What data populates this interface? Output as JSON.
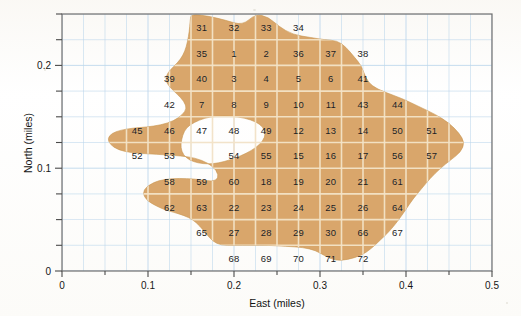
{
  "figure": {
    "type": "map",
    "fill_color": "#d9a66b",
    "grid_color": "#bcd7ec",
    "frame_color": "#6e6e6e",
    "cell_divider_color": "#f4e3c8"
  },
  "axes": {
    "x": {
      "title": "East (miles)",
      "min": 0,
      "max": 0.5,
      "major_ticks": [
        0,
        0.1,
        0.2,
        0.3,
        0.4,
        0.5
      ],
      "tick_labels": [
        "0",
        "0.1",
        "0.2",
        "0.3",
        "0.4",
        "0.5"
      ],
      "minor_tick_step": 0.025
    },
    "y": {
      "title": "North (miles)",
      "min": 0,
      "max": 0.25,
      "major_ticks": [
        0,
        0.1,
        0.2
      ],
      "tick_labels": [
        "0",
        "0.1",
        "0.2"
      ],
      "minor_tick_step": 0.025
    }
  },
  "chart_data": {
    "type": "map",
    "title": "",
    "xlabel": "East (miles)",
    "ylabel": "North (miles)",
    "xlim": [
      0,
      0.5
    ],
    "ylim": [
      0,
      0.25
    ],
    "grid": true,
    "legend": "none",
    "cell_size_miles": 0.025,
    "region_fill": "#d9a66b",
    "labels": [
      {
        "id": "31",
        "x": 0.1625,
        "y": 0.2375,
        "inside": false
      },
      {
        "id": "32",
        "x": 0.2,
        "y": 0.2375,
        "inside": false
      },
      {
        "id": "33",
        "x": 0.2375,
        "y": 0.2375,
        "inside": true
      },
      {
        "id": "34",
        "x": 0.275,
        "y": 0.2375,
        "inside": false
      },
      {
        "id": "35",
        "x": 0.1625,
        "y": 0.2125,
        "inside": true
      },
      {
        "id": "1",
        "x": 0.2,
        "y": 0.2125,
        "inside": true
      },
      {
        "id": "2",
        "x": 0.2375,
        "y": 0.2125,
        "inside": true
      },
      {
        "id": "36",
        "x": 0.275,
        "y": 0.2125,
        "inside": true
      },
      {
        "id": "37",
        "x": 0.3125,
        "y": 0.2125,
        "inside": true
      },
      {
        "id": "38",
        "x": 0.35,
        "y": 0.2125,
        "inside": false
      },
      {
        "id": "39",
        "x": 0.125,
        "y": 0.1875,
        "inside": false
      },
      {
        "id": "40",
        "x": 0.1625,
        "y": 0.1875,
        "inside": true
      },
      {
        "id": "3",
        "x": 0.2,
        "y": 0.1875,
        "inside": true
      },
      {
        "id": "4",
        "x": 0.2375,
        "y": 0.1875,
        "inside": true
      },
      {
        "id": "5",
        "x": 0.275,
        "y": 0.1875,
        "inside": true
      },
      {
        "id": "6",
        "x": 0.3125,
        "y": 0.1875,
        "inside": true
      },
      {
        "id": "41",
        "x": 0.35,
        "y": 0.1875,
        "inside": false
      },
      {
        "id": "42",
        "x": 0.125,
        "y": 0.1625,
        "inside": true
      },
      {
        "id": "7",
        "x": 0.1625,
        "y": 0.1625,
        "inside": true
      },
      {
        "id": "8",
        "x": 0.2,
        "y": 0.1625,
        "inside": true
      },
      {
        "id": "9",
        "x": 0.2375,
        "y": 0.1625,
        "inside": true
      },
      {
        "id": "10",
        "x": 0.275,
        "y": 0.1625,
        "inside": true
      },
      {
        "id": "11",
        "x": 0.3125,
        "y": 0.1625,
        "inside": true
      },
      {
        "id": "43",
        "x": 0.35,
        "y": 0.1625,
        "inside": true
      },
      {
        "id": "44",
        "x": 0.39,
        "y": 0.1625,
        "inside": false
      },
      {
        "id": "45",
        "x": 0.0875,
        "y": 0.1375,
        "inside": false
      },
      {
        "id": "46",
        "x": 0.125,
        "y": 0.1375,
        "inside": true
      },
      {
        "id": "47",
        "x": 0.1625,
        "y": 0.1375,
        "inside": false
      },
      {
        "id": "48",
        "x": 0.2,
        "y": 0.1375,
        "inside": false
      },
      {
        "id": "49",
        "x": 0.2375,
        "y": 0.1375,
        "inside": true
      },
      {
        "id": "12",
        "x": 0.275,
        "y": 0.1375,
        "inside": true
      },
      {
        "id": "13",
        "x": 0.3125,
        "y": 0.1375,
        "inside": true
      },
      {
        "id": "14",
        "x": 0.35,
        "y": 0.1375,
        "inside": true
      },
      {
        "id": "50",
        "x": 0.39,
        "y": 0.1375,
        "inside": true
      },
      {
        "id": "51",
        "x": 0.43,
        "y": 0.1375,
        "inside": false
      },
      {
        "id": "52",
        "x": 0.0875,
        "y": 0.1125,
        "inside": true
      },
      {
        "id": "53",
        "x": 0.125,
        "y": 0.1125,
        "inside": false
      },
      {
        "id": "54",
        "x": 0.2,
        "y": 0.1125,
        "inside": false
      },
      {
        "id": "55",
        "x": 0.2375,
        "y": 0.1125,
        "inside": true
      },
      {
        "id": "15",
        "x": 0.275,
        "y": 0.1125,
        "inside": true
      },
      {
        "id": "16",
        "x": 0.3125,
        "y": 0.1125,
        "inside": true
      },
      {
        "id": "17",
        "x": 0.35,
        "y": 0.1125,
        "inside": true
      },
      {
        "id": "56",
        "x": 0.39,
        "y": 0.1125,
        "inside": true
      },
      {
        "id": "57",
        "x": 0.43,
        "y": 0.1125,
        "inside": false
      },
      {
        "id": "58",
        "x": 0.125,
        "y": 0.0875,
        "inside": false
      },
      {
        "id": "59",
        "x": 0.1625,
        "y": 0.0875,
        "inside": false
      },
      {
        "id": "60",
        "x": 0.2,
        "y": 0.0875,
        "inside": true
      },
      {
        "id": "18",
        "x": 0.2375,
        "y": 0.0875,
        "inside": true
      },
      {
        "id": "19",
        "x": 0.275,
        "y": 0.0875,
        "inside": true
      },
      {
        "id": "20",
        "x": 0.3125,
        "y": 0.0875,
        "inside": true
      },
      {
        "id": "21",
        "x": 0.35,
        "y": 0.0875,
        "inside": true
      },
      {
        "id": "61",
        "x": 0.39,
        "y": 0.0875,
        "inside": true
      },
      {
        "id": "62",
        "x": 0.125,
        "y": 0.0625,
        "inside": false
      },
      {
        "id": "63",
        "x": 0.1625,
        "y": 0.0625,
        "inside": true
      },
      {
        "id": "22",
        "x": 0.2,
        "y": 0.0625,
        "inside": true
      },
      {
        "id": "23",
        "x": 0.2375,
        "y": 0.0625,
        "inside": true
      },
      {
        "id": "24",
        "x": 0.275,
        "y": 0.0625,
        "inside": true
      },
      {
        "id": "25",
        "x": 0.3125,
        "y": 0.0625,
        "inside": true
      },
      {
        "id": "26",
        "x": 0.35,
        "y": 0.0625,
        "inside": true
      },
      {
        "id": "64",
        "x": 0.39,
        "y": 0.0625,
        "inside": true
      },
      {
        "id": "65",
        "x": 0.1625,
        "y": 0.0375,
        "inside": false
      },
      {
        "id": "27",
        "x": 0.2,
        "y": 0.0375,
        "inside": true
      },
      {
        "id": "28",
        "x": 0.2375,
        "y": 0.0375,
        "inside": true
      },
      {
        "id": "29",
        "x": 0.275,
        "y": 0.0375,
        "inside": true
      },
      {
        "id": "30",
        "x": 0.3125,
        "y": 0.0375,
        "inside": true
      },
      {
        "id": "66",
        "x": 0.35,
        "y": 0.0375,
        "inside": true
      },
      {
        "id": "67",
        "x": 0.39,
        "y": 0.0375,
        "inside": false
      },
      {
        "id": "68",
        "x": 0.2,
        "y": 0.0125,
        "inside": false
      },
      {
        "id": "69",
        "x": 0.2375,
        "y": 0.0125,
        "inside": false
      },
      {
        "id": "70",
        "x": 0.275,
        "y": 0.0125,
        "inside": false
      },
      {
        "id": "71",
        "x": 0.3125,
        "y": 0.0125,
        "inside": true
      },
      {
        "id": "72",
        "x": 0.35,
        "y": 0.0125,
        "inside": true
      }
    ],
    "region_outline": [
      [
        0.15,
        0.25
      ],
      [
        0.17,
        0.248
      ],
      [
        0.19,
        0.244
      ],
      [
        0.21,
        0.239
      ],
      [
        0.225,
        0.25
      ],
      [
        0.24,
        0.247
      ],
      [
        0.252,
        0.238
      ],
      [
        0.268,
        0.23
      ],
      [
        0.29,
        0.227
      ],
      [
        0.305,
        0.225
      ],
      [
        0.32,
        0.224
      ],
      [
        0.33,
        0.218
      ],
      [
        0.34,
        0.208
      ],
      [
        0.348,
        0.2
      ],
      [
        0.353,
        0.188
      ],
      [
        0.36,
        0.18
      ],
      [
        0.375,
        0.174
      ],
      [
        0.395,
        0.168
      ],
      [
        0.415,
        0.16
      ],
      [
        0.435,
        0.152
      ],
      [
        0.45,
        0.144
      ],
      [
        0.462,
        0.134
      ],
      [
        0.468,
        0.125
      ],
      [
        0.464,
        0.116
      ],
      [
        0.452,
        0.108
      ],
      [
        0.44,
        0.1
      ],
      [
        0.428,
        0.09
      ],
      [
        0.418,
        0.08
      ],
      [
        0.408,
        0.07
      ],
      [
        0.4,
        0.06
      ],
      [
        0.39,
        0.048
      ],
      [
        0.38,
        0.038
      ],
      [
        0.37,
        0.03
      ],
      [
        0.36,
        0.022
      ],
      [
        0.348,
        0.015
      ],
      [
        0.332,
        0.011
      ],
      [
        0.318,
        0.01
      ],
      [
        0.305,
        0.015
      ],
      [
        0.295,
        0.02
      ],
      [
        0.28,
        0.023
      ],
      [
        0.26,
        0.024
      ],
      [
        0.24,
        0.025
      ],
      [
        0.22,
        0.025
      ],
      [
        0.2,
        0.025
      ],
      [
        0.185,
        0.025
      ],
      [
        0.175,
        0.029
      ],
      [
        0.168,
        0.036
      ],
      [
        0.16,
        0.044
      ],
      [
        0.152,
        0.05
      ],
      [
        0.142,
        0.054
      ],
      [
        0.13,
        0.057
      ],
      [
        0.118,
        0.06
      ],
      [
        0.108,
        0.064
      ],
      [
        0.1,
        0.068
      ],
      [
        0.095,
        0.073
      ],
      [
        0.095,
        0.079
      ],
      [
        0.102,
        0.084
      ],
      [
        0.112,
        0.088
      ],
      [
        0.128,
        0.09
      ],
      [
        0.145,
        0.09
      ],
      [
        0.16,
        0.089
      ],
      [
        0.175,
        0.087
      ],
      [
        0.182,
        0.09
      ],
      [
        0.18,
        0.098
      ],
      [
        0.17,
        0.105
      ],
      [
        0.155,
        0.11
      ],
      [
        0.138,
        0.112
      ],
      [
        0.12,
        0.113
      ],
      [
        0.1,
        0.114
      ],
      [
        0.08,
        0.115
      ],
      [
        0.065,
        0.118
      ],
      [
        0.056,
        0.123
      ],
      [
        0.053,
        0.129
      ],
      [
        0.058,
        0.134
      ],
      [
        0.068,
        0.137
      ],
      [
        0.082,
        0.139
      ],
      [
        0.098,
        0.14
      ],
      [
        0.115,
        0.142
      ],
      [
        0.13,
        0.146
      ],
      [
        0.14,
        0.152
      ],
      [
        0.145,
        0.158
      ],
      [
        0.142,
        0.165
      ],
      [
        0.134,
        0.172
      ],
      [
        0.125,
        0.179
      ],
      [
        0.12,
        0.186
      ],
      [
        0.123,
        0.193
      ],
      [
        0.13,
        0.199
      ],
      [
        0.138,
        0.206
      ],
      [
        0.143,
        0.214
      ],
      [
        0.146,
        0.223
      ],
      [
        0.148,
        0.233
      ],
      [
        0.149,
        0.243
      ]
    ],
    "region_hole": [
      [
        0.148,
        0.142
      ],
      [
        0.16,
        0.147
      ],
      [
        0.172,
        0.15
      ],
      [
        0.188,
        0.151
      ],
      [
        0.205,
        0.15
      ],
      [
        0.22,
        0.147
      ],
      [
        0.23,
        0.143
      ],
      [
        0.236,
        0.137
      ],
      [
        0.236,
        0.13
      ],
      [
        0.23,
        0.123
      ],
      [
        0.22,
        0.117
      ],
      [
        0.208,
        0.112
      ],
      [
        0.195,
        0.108
      ],
      [
        0.182,
        0.105
      ],
      [
        0.17,
        0.104
      ],
      [
        0.158,
        0.105
      ],
      [
        0.148,
        0.108
      ],
      [
        0.141,
        0.113
      ],
      [
        0.138,
        0.12
      ],
      [
        0.139,
        0.128
      ],
      [
        0.142,
        0.136
      ]
    ]
  }
}
